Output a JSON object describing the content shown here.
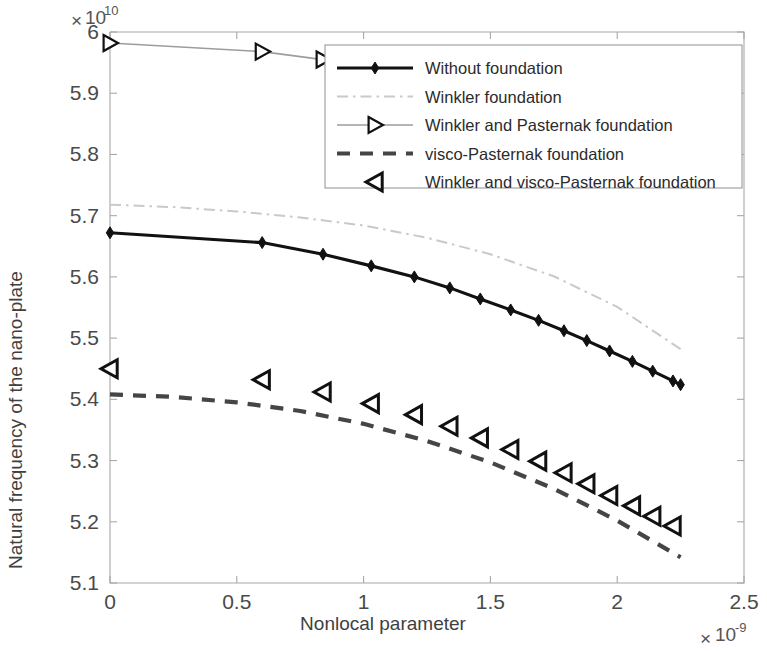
{
  "chart_data": {
    "type": "line",
    "title": "",
    "xlabel": "Nonlocal parameter",
    "ylabel": "Natural frequency of the nano-plate",
    "x_multiplier_base": "10",
    "x_multiplier_exp": "-9",
    "y_multiplier_base": "10",
    "y_multiplier_exp": "10",
    "x_multiplier_symbol": "×",
    "xlim": [
      0,
      2.5
    ],
    "ylim": [
      5.1,
      6.0
    ],
    "xticks": [
      "0",
      "0.5",
      "1",
      "1.5",
      "2",
      "2.5"
    ],
    "xtick_values": [
      0,
      0.5,
      1,
      1.5,
      2,
      2.5
    ],
    "yticks": [
      "5.1",
      "5.2",
      "5.3",
      "5.4",
      "5.5",
      "5.6",
      "5.7",
      "5.8",
      "5.9",
      "6"
    ],
    "ytick_values": [
      5.1,
      5.2,
      5.3,
      5.4,
      5.5,
      5.6,
      5.7,
      5.8,
      5.9,
      6.0
    ],
    "grid": false,
    "legend_position": "top-right-inside",
    "series": [
      {
        "name": "Without foundation",
        "marker": "diamond-filled",
        "line_style": "solid",
        "color": "#111111",
        "x": [
          0,
          0.6,
          0.84,
          1.03,
          1.2,
          1.34,
          1.46,
          1.58,
          1.69,
          1.79,
          1.88,
          1.97,
          2.06,
          2.14,
          2.22,
          2.25
        ],
        "y": [
          5.672,
          5.656,
          5.637,
          5.618,
          5.6,
          5.582,
          5.564,
          5.546,
          5.529,
          5.512,
          5.496,
          5.479,
          5.462,
          5.446,
          5.43,
          5.424
        ]
      },
      {
        "name": "Winkler foundation",
        "marker": "none",
        "line_style": "dash-dot",
        "color": "#c9c9c9",
        "x": [
          0,
          0.25,
          0.5,
          0.75,
          1.0,
          1.25,
          1.5,
          1.75,
          2.0,
          2.25
        ],
        "y": [
          5.718,
          5.714,
          5.707,
          5.697,
          5.684,
          5.664,
          5.637,
          5.601,
          5.551,
          5.482
        ]
      },
      {
        "name": "Winkler and Pasternak foundation",
        "marker": "triangle-right",
        "line_style": "solid",
        "color": "#9d9d9d",
        "x": [
          0,
          0.6,
          0.84,
          1.03,
          1.2,
          1.34,
          1.46,
          1.58,
          1.69,
          1.79,
          1.88,
          1.97,
          2.06,
          2.14,
          2.22,
          2.25
        ],
        "y": [
          5.982,
          5.968,
          5.955,
          5.944,
          5.934,
          5.925,
          5.916,
          5.908,
          5.9,
          5.892,
          5.885,
          5.877,
          5.87,
          5.863,
          5.856,
          5.854
        ]
      },
      {
        "name": "visco-Pasternak foundation",
        "marker": "none",
        "line_style": "dashed",
        "color": "#454545",
        "x": [
          0,
          0.25,
          0.5,
          0.75,
          1.0,
          1.25,
          1.5,
          1.75,
          2.0,
          2.25
        ],
        "y": [
          5.408,
          5.404,
          5.395,
          5.381,
          5.36,
          5.332,
          5.297,
          5.254,
          5.202,
          5.142
        ]
      },
      {
        "name": "Winkler and visco-Pasternak foundation",
        "marker": "triangle-left",
        "line_style": "none",
        "color": "#111111",
        "x": [
          0,
          0.6,
          0.84,
          1.03,
          1.2,
          1.34,
          1.46,
          1.58,
          1.69,
          1.79,
          1.88,
          1.97,
          2.06,
          2.14,
          2.22
        ],
        "y": [
          5.45,
          5.432,
          5.412,
          5.393,
          5.375,
          5.356,
          5.337,
          5.318,
          5.299,
          5.28,
          5.262,
          5.243,
          5.226,
          5.209,
          5.193
        ]
      }
    ],
    "legend": [
      {
        "label": "Without foundation",
        "swatch": "line-solid-diamond",
        "color": "#111111"
      },
      {
        "label": "Winkler foundation",
        "swatch": "line-dashdot",
        "color": "#c9c9c9"
      },
      {
        "label": "Winkler and Pasternak foundation",
        "swatch": "line-solid-triangle-right",
        "color": "#9d9d9d"
      },
      {
        "label": "visco-Pasternak foundation",
        "swatch": "line-dashed",
        "color": "#454545"
      },
      {
        "label": "Winkler and visco-Pasternak foundation",
        "swatch": "marker-triangle-left",
        "color": "#111111"
      }
    ]
  }
}
